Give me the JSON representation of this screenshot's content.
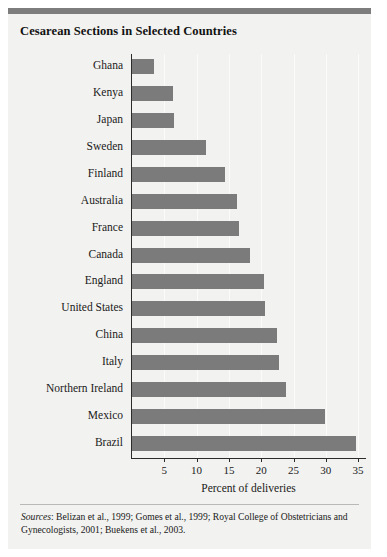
{
  "figure": {
    "title": "Cesarean Sections in Selected Countries",
    "source_prefix": "Sources",
    "source_separator": ": ",
    "source_text": "Belizan et al., 1999; Gomes et al., 1999; Royal College of Obstetricians and Gynecologists, 2001; Buekens et al., 2003."
  },
  "colors": {
    "bar": "#7b7b7b",
    "top_rule": "#7d7d7d",
    "background": "#f2f2f0",
    "axis": "#2b2b2b",
    "gridline": "#fbfbfb",
    "text": "#1a1a1a"
  },
  "chart_data": {
    "type": "bar",
    "orientation": "horizontal",
    "title": "Cesarean Sections in Selected Countries",
    "xlabel": "Percent of deliveries",
    "ylabel": "",
    "xlim": [
      0,
      36.5
    ],
    "xticks": [
      5,
      10,
      15,
      20,
      25,
      30,
      35
    ],
    "xtick_labels": [
      "5",
      "10",
      "15",
      "20",
      "25",
      "30",
      "35"
    ],
    "grid": true,
    "legend": false,
    "categories": [
      "Ghana",
      "Kenya",
      "Japan",
      "Sweden",
      "Finland",
      "Australia",
      "France",
      "Canada",
      "England",
      "United States",
      "China",
      "Italy",
      "Northern Ireland",
      "Mexico",
      "Brazil"
    ],
    "values": [
      3.4,
      6.3,
      6.5,
      11.5,
      14.4,
      16.3,
      16.5,
      18.2,
      20.5,
      20.6,
      22.5,
      22.7,
      23.9,
      29.8,
      34.6
    ]
  }
}
